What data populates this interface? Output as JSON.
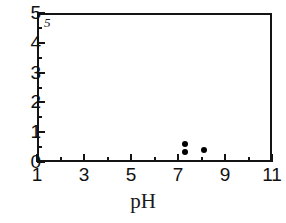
{
  "chart_data": {
    "type": "scatter",
    "title": "",
    "panel_label": "5",
    "xlabel": "pH",
    "ylabel": "",
    "xlim": [
      1,
      11
    ],
    "ylim": [
      0,
      5
    ],
    "x_major_ticks": [
      1,
      3,
      5,
      7,
      9,
      11
    ],
    "x_minor_ticks": [
      2,
      4,
      6,
      8,
      10
    ],
    "x_tick_labels": [
      "1",
      "3",
      "5",
      "7",
      "9",
      "11"
    ],
    "y_major_ticks": [
      0,
      1,
      2,
      3,
      4,
      5
    ],
    "y_minor_ticks": [
      0.5,
      1.5,
      2.5,
      3.5,
      4.5
    ],
    "y_tick_labels": [
      "0",
      "1",
      "2",
      "3",
      "4",
      "5"
    ],
    "grid": false,
    "legend": false,
    "series": [
      {
        "name": "data",
        "marker": "filled-circle",
        "color": "#000000",
        "points": [
          {
            "x": 7.3,
            "y": 0.6
          },
          {
            "x": 7.3,
            "y": 0.33
          },
          {
            "x": 8.1,
            "y": 0.4
          }
        ]
      }
    ]
  },
  "axes": {
    "frame_color": "#141414",
    "background": "#ffffff"
  }
}
